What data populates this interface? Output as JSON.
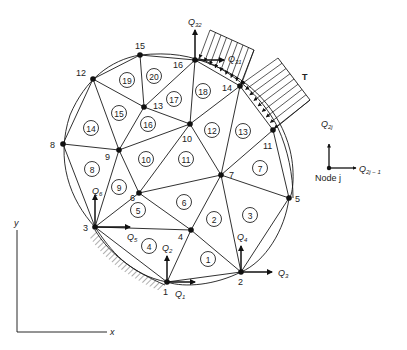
{
  "diagram": {
    "type": "finite-element-mesh",
    "nodes": [
      {
        "id": "1",
        "x": 167,
        "y": 282,
        "lx": 163,
        "ly": 295
      },
      {
        "id": "2",
        "x": 241,
        "y": 272,
        "lx": 238,
        "ly": 285
      },
      {
        "id": "3",
        "x": 95,
        "y": 227,
        "lx": 83,
        "ly": 231
      },
      {
        "id": "4",
        "x": 191,
        "y": 230,
        "lx": 178,
        "ly": 240
      },
      {
        "id": "5",
        "x": 289,
        "y": 198,
        "lx": 295,
        "ly": 202
      },
      {
        "id": "6",
        "x": 139,
        "y": 193,
        "lx": 130,
        "ly": 201
      },
      {
        "id": "7",
        "x": 221,
        "y": 175,
        "lx": 229,
        "ly": 178
      },
      {
        "id": "8",
        "x": 63,
        "y": 144,
        "lx": 50,
        "ly": 148
      },
      {
        "id": "9",
        "x": 119,
        "y": 150,
        "lx": 105,
        "ly": 160
      },
      {
        "id": "10",
        "x": 190,
        "y": 124,
        "lx": 182,
        "ly": 142
      },
      {
        "id": "11",
        "x": 273,
        "y": 130,
        "lx": 263,
        "ly": 149
      },
      {
        "id": "12",
        "x": 93,
        "y": 79,
        "lx": 76,
        "ly": 76
      },
      {
        "id": "13",
        "x": 144,
        "y": 107,
        "lx": 153,
        "ly": 109
      },
      {
        "id": "14",
        "x": 240,
        "y": 86,
        "lx": 222,
        "ly": 91
      },
      {
        "id": "15",
        "x": 140,
        "y": 55,
        "lx": 135,
        "ly": 49
      },
      {
        "id": "16",
        "x": 195,
        "y": 60,
        "lx": 173,
        "ly": 68
      }
    ],
    "elements": [
      {
        "id": "1",
        "cx": 208,
        "cy": 259
      },
      {
        "id": "2",
        "cx": 214,
        "cy": 219
      },
      {
        "id": "3",
        "cx": 250,
        "cy": 215
      },
      {
        "id": "4",
        "cx": 149,
        "cy": 246
      },
      {
        "id": "5",
        "cx": 138,
        "cy": 210
      },
      {
        "id": "6",
        "cx": 184,
        "cy": 202
      },
      {
        "id": "7",
        "cx": 260,
        "cy": 168
      },
      {
        "id": "8",
        "cx": 92,
        "cy": 169
      },
      {
        "id": "9",
        "cx": 119,
        "cy": 187
      },
      {
        "id": "10",
        "cx": 146,
        "cy": 159
      },
      {
        "id": "11",
        "cx": 186,
        "cy": 159
      },
      {
        "id": "12",
        "cx": 212,
        "cy": 130
      },
      {
        "id": "13",
        "cx": 243,
        "cy": 131
      },
      {
        "id": "14",
        "cx": 91,
        "cy": 128
      },
      {
        "id": "15",
        "cx": 119,
        "cy": 113
      },
      {
        "id": "16",
        "cx": 148,
        "cy": 124
      },
      {
        "id": "17",
        "cx": 174,
        "cy": 99
      },
      {
        "id": "18",
        "cx": 203,
        "cy": 91
      },
      {
        "id": "19",
        "cx": 127,
        "cy": 80
      },
      {
        "id": "20",
        "cx": 154,
        "cy": 76
      }
    ],
    "edges": [
      [
        "1",
        "2"
      ],
      [
        "1",
        "3"
      ],
      [
        "1",
        "4"
      ],
      [
        "2",
        "4"
      ],
      [
        "2",
        "5"
      ],
      [
        "2",
        "7"
      ],
      [
        "3",
        "4"
      ],
      [
        "3",
        "6"
      ],
      [
        "3",
        "8"
      ],
      [
        "3",
        "9"
      ],
      [
        "4",
        "6"
      ],
      [
        "4",
        "7"
      ],
      [
        "5",
        "7"
      ],
      [
        "5",
        "11"
      ],
      [
        "6",
        "7"
      ],
      [
        "6",
        "9"
      ],
      [
        "6",
        "10"
      ],
      [
        "7",
        "10"
      ],
      [
        "7",
        "11"
      ],
      [
        "7",
        "14"
      ],
      [
        "8",
        "9"
      ],
      [
        "8",
        "12"
      ],
      [
        "9",
        "10"
      ],
      [
        "9",
        "12"
      ],
      [
        "9",
        "13"
      ],
      [
        "10",
        "13"
      ],
      [
        "10",
        "14"
      ],
      [
        "10",
        "16"
      ],
      [
        "11",
        "14"
      ],
      [
        "12",
        "13"
      ],
      [
        "12",
        "15"
      ],
      [
        "13",
        "15"
      ],
      [
        "13",
        "16"
      ],
      [
        "14",
        "16"
      ],
      [
        "15",
        "16"
      ]
    ],
    "dof_labels": [
      {
        "base": "Q",
        "sub": "1",
        "x": 175,
        "y": 297
      },
      {
        "base": "Q",
        "sub": "2",
        "x": 162,
        "y": 251
      },
      {
        "base": "Q",
        "sub": "3",
        "x": 278,
        "y": 276
      },
      {
        "base": "Q",
        "sub": "4",
        "x": 237,
        "y": 240
      },
      {
        "base": "Q",
        "sub": "5",
        "x": 127,
        "y": 240
      },
      {
        "base": "Q",
        "sub": "6",
        "x": 92,
        "y": 194
      },
      {
        "base": "Q",
        "sub": "31",
        "x": 228,
        "y": 62
      },
      {
        "base": "Q",
        "sub": "32",
        "x": 188,
        "y": 25
      }
    ],
    "traction_label": "T",
    "legend": {
      "node_label": "Node j",
      "q_vertical": {
        "base": "Q",
        "sub": "2j"
      },
      "q_horizontal": {
        "base": "Q",
        "sub": "2j − 1"
      }
    },
    "axes": {
      "x_label": "x",
      "y_label": "y"
    }
  }
}
